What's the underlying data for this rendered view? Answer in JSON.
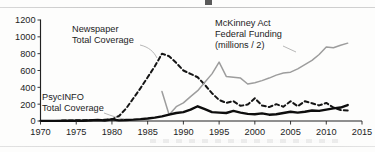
{
  "figure": {
    "name": "homelessness-coverage-figure",
    "background_color": "#fdfdfc",
    "ink_color": "#1c1c1c"
  },
  "annotations": {
    "newspaper": {
      "line1": "Newspaper",
      "line2": "Total Coverage"
    },
    "mckinney": {
      "line1": "McKinney Act",
      "line2": "Federal Funding",
      "line3": "(millions / 2)"
    },
    "psycinfo": {
      "line1": "PsycINFO",
      "line2": "Total Coverage"
    }
  },
  "chart_data": {
    "type": "line",
    "title": "",
    "xlabel": "",
    "ylabel": "",
    "xlim": [
      1970,
      2015
    ],
    "ylim": [
      0,
      1200
    ],
    "xticks": [
      1970,
      1975,
      1980,
      1985,
      1990,
      1995,
      2000,
      2005,
      2010,
      2015
    ],
    "yticks": [
      0,
      200,
      400,
      600,
      800,
      1000,
      1200
    ],
    "grid": false,
    "legend": "inline-annotations",
    "series": [
      {
        "name": "Newspaper Total Coverage",
        "color": "#151515",
        "style": "dashed",
        "x": [
          1973,
          1974,
          1975,
          1976,
          1977,
          1978,
          1979,
          1980,
          1981,
          1982,
          1983,
          1984,
          1985,
          1986,
          1987,
          1988,
          1989,
          1990,
          1991,
          1992,
          1993,
          1994,
          1995,
          1996,
          1997,
          1998,
          1999,
          2000,
          2001,
          2002,
          2003,
          2004,
          2005,
          2006,
          2007,
          2008,
          2009,
          2010,
          2011,
          2012,
          2013
        ],
        "values": [
          5,
          6,
          8,
          8,
          10,
          12,
          15,
          20,
          60,
          150,
          270,
          390,
          520,
          650,
          800,
          770,
          690,
          600,
          560,
          520,
          430,
          330,
          250,
          215,
          235,
          180,
          195,
          270,
          185,
          165,
          200,
          170,
          235,
          175,
          235,
          210,
          185,
          215,
          160,
          130,
          125
        ]
      },
      {
        "name": "McKinney Act Federal Funding (millions / 2)",
        "color": "#9d9d9d",
        "style": "solid",
        "x": [
          1987,
          1988,
          1989,
          1990,
          1991,
          1992,
          1993,
          1994,
          1995,
          1996,
          1997,
          1998,
          1999,
          2000,
          2001,
          2002,
          2003,
          2004,
          2005,
          2006,
          2007,
          2008,
          2009,
          2010,
          2011,
          2012,
          2013
        ],
        "values": [
          350,
          75,
          170,
          215,
          290,
          360,
          460,
          560,
          700,
          530,
          520,
          510,
          440,
          455,
          480,
          510,
          545,
          570,
          580,
          620,
          670,
          720,
          790,
          880,
          870,
          900,
          925
        ]
      },
      {
        "name": "PsycINFO Total Coverage",
        "color": "#0d0d0d",
        "style": "solid-bold",
        "x": [
          1970,
          1972,
          1974,
          1976,
          1978,
          1979,
          1980,
          1981,
          1982,
          1983,
          1984,
          1985,
          1986,
          1987,
          1988,
          1989,
          1990,
          1991,
          1992,
          1993,
          1994,
          1995,
          1996,
          1997,
          1998,
          1999,
          2000,
          2001,
          2002,
          2003,
          2004,
          2005,
          2006,
          2007,
          2008,
          2009,
          2010,
          2011,
          2012,
          2013
        ],
        "values": [
          2,
          2,
          3,
          3,
          12,
          6,
          20,
          8,
          12,
          16,
          22,
          30,
          40,
          55,
          75,
          95,
          105,
          135,
          175,
          140,
          105,
          100,
          95,
          120,
          100,
          85,
          80,
          90,
          75,
          80,
          95,
          110,
          100,
          110,
          125,
          120,
          135,
          150,
          160,
          190
        ]
      }
    ]
  }
}
